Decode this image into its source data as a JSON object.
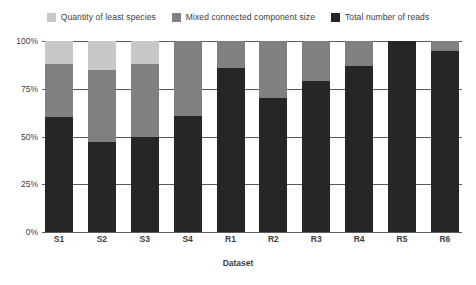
{
  "chart_data": {
    "type": "bar",
    "stacked": true,
    "normalized": true,
    "title": "",
    "xlabel": "Dataset",
    "ylabel": "",
    "ylim": [
      0,
      100
    ],
    "yticks": [
      "0%",
      "25%",
      "50%",
      "75%",
      "100%"
    ],
    "ytick_values": [
      0,
      25,
      50,
      75,
      100
    ],
    "grid": true,
    "legend_position": "top",
    "categories": [
      "S1",
      "S2",
      "S3",
      "S4",
      "R1",
      "R2",
      "R3",
      "R4",
      "R5",
      "R6"
    ],
    "series": [
      {
        "name": "Total number of reads",
        "color": "#262626",
        "values": [
          60,
          47,
          50,
          61,
          86,
          70,
          79,
          87,
          100,
          95
        ]
      },
      {
        "name": "Mixed connected component size",
        "color": "#808080",
        "values": [
          28,
          38,
          38,
          39,
          14,
          30,
          21,
          13,
          0,
          5
        ]
      },
      {
        "name": "Quantity of least species",
        "color": "#c8c8c8",
        "values": [
          12,
          15,
          12,
          0,
          0,
          0,
          0,
          0,
          0,
          0
        ]
      }
    ],
    "legend": [
      {
        "label": "Quantity of least species",
        "color": "#c8c8c8"
      },
      {
        "label": "Mixed connected component size",
        "color": "#808080"
      },
      {
        "label": "Total number of reads",
        "color": "#262626"
      }
    ]
  }
}
